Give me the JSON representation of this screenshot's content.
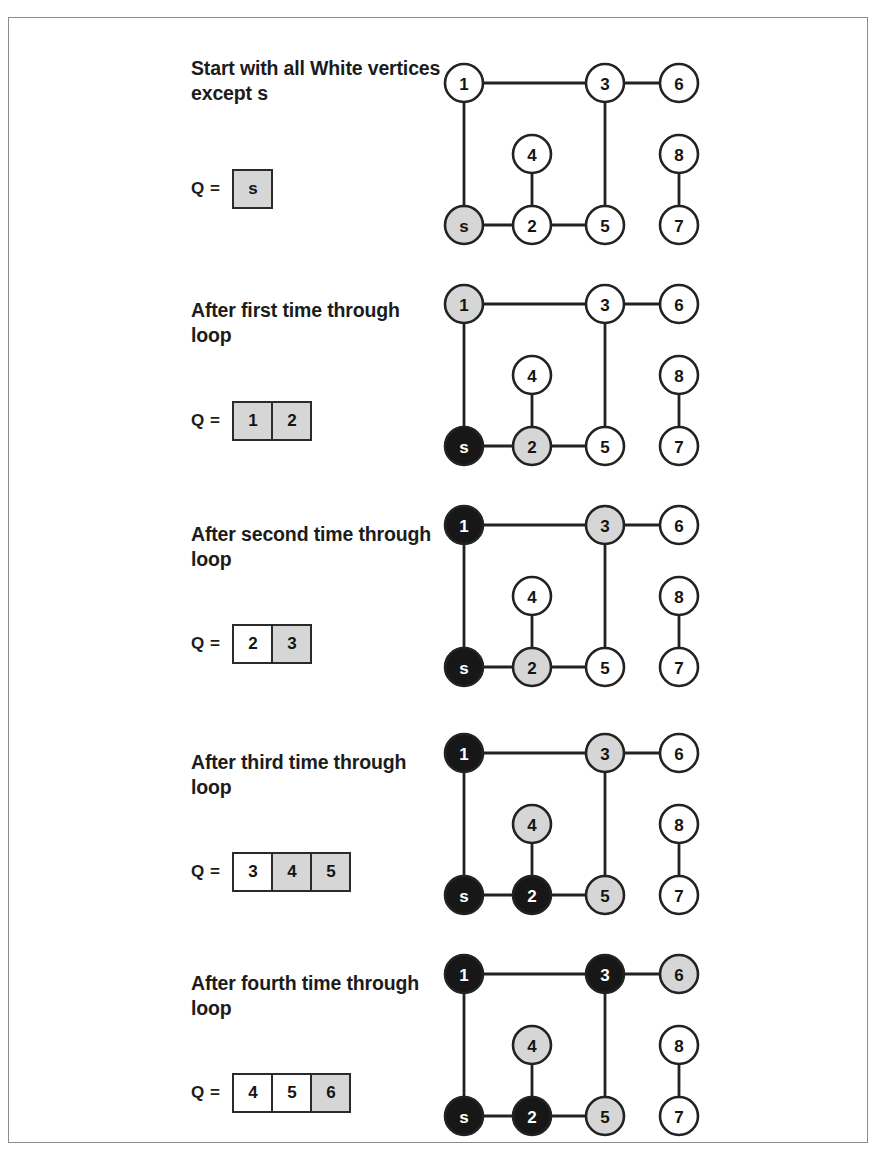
{
  "figure": {
    "border_color": "#8d8d8d",
    "background": "#ffffff"
  },
  "colors": {
    "white_node": "#ffffff",
    "gray_node": "#d6d6d6",
    "black_node": "#171717",
    "stroke": "#222222",
    "text_dark": "#141414",
    "text_light": "#ffffff"
  },
  "graph_layout": {
    "nodes": [
      {
        "id": "1",
        "cx": 37,
        "cy": 37
      },
      {
        "id": "3",
        "cx": 178,
        "cy": 37
      },
      {
        "id": "6",
        "cx": 252,
        "cy": 37
      },
      {
        "id": "4",
        "cx": 105,
        "cy": 108
      },
      {
        "id": "8",
        "cx": 252,
        "cy": 108
      },
      {
        "id": "s",
        "cx": 37,
        "cy": 179
      },
      {
        "id": "2",
        "cx": 105,
        "cy": 179
      },
      {
        "id": "5",
        "cx": 178,
        "cy": 179
      },
      {
        "id": "7",
        "cx": 252,
        "cy": 179
      }
    ],
    "radius": 19,
    "edges": [
      [
        "1",
        "3"
      ],
      [
        "3",
        "6"
      ],
      [
        "1",
        "s"
      ],
      [
        "3",
        "5"
      ],
      [
        "4",
        "2"
      ],
      [
        "8",
        "7"
      ],
      [
        "s",
        "2"
      ],
      [
        "2",
        "5"
      ]
    ]
  },
  "panels": [
    {
      "caption": "Start with all White vertices except s",
      "q_label": "Q =",
      "queue": [
        {
          "value": "s",
          "fill": "gray"
        }
      ],
      "node_states": {
        "1": "white",
        "2": "white",
        "3": "white",
        "4": "white",
        "5": "white",
        "6": "white",
        "7": "white",
        "8": "white",
        "s": "gray"
      }
    },
    {
      "caption": "After first time through loop",
      "q_label": "Q =",
      "queue": [
        {
          "value": "1",
          "fill": "gray"
        },
        {
          "value": "2",
          "fill": "gray"
        }
      ],
      "node_states": {
        "1": "gray",
        "2": "gray",
        "3": "white",
        "4": "white",
        "5": "white",
        "6": "white",
        "7": "white",
        "8": "white",
        "s": "black"
      }
    },
    {
      "caption": "After second time through loop",
      "q_label": "Q =",
      "queue": [
        {
          "value": "2",
          "fill": "white"
        },
        {
          "value": "3",
          "fill": "gray"
        }
      ],
      "node_states": {
        "1": "black",
        "2": "gray",
        "3": "gray",
        "4": "white",
        "5": "white",
        "6": "white",
        "7": "white",
        "8": "white",
        "s": "black"
      }
    },
    {
      "caption": "After third time through loop",
      "q_label": "Q =",
      "queue": [
        {
          "value": "3",
          "fill": "white"
        },
        {
          "value": "4",
          "fill": "gray"
        },
        {
          "value": "5",
          "fill": "gray"
        }
      ],
      "node_states": {
        "1": "black",
        "2": "black",
        "3": "gray",
        "4": "gray",
        "5": "gray",
        "6": "white",
        "7": "white",
        "8": "white",
        "s": "black"
      }
    },
    {
      "caption": "After fourth time through loop",
      "q_label": "Q =",
      "queue": [
        {
          "value": "4",
          "fill": "white"
        },
        {
          "value": "5",
          "fill": "white"
        },
        {
          "value": "6",
          "fill": "gray"
        }
      ],
      "node_states": {
        "1": "black",
        "2": "black",
        "3": "black",
        "4": "gray",
        "5": "gray",
        "6": "gray",
        "7": "white",
        "8": "white",
        "s": "black"
      }
    }
  ]
}
